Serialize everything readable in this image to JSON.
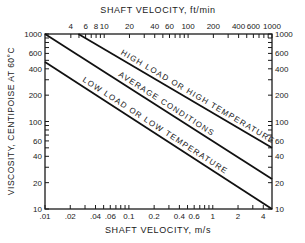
{
  "chart_data": {
    "type": "line",
    "title": "",
    "xlabel": "SHAFT VELOCITY, m/s",
    "x2label": "SHAFT VELOCITY, ft/min",
    "ylabel": "VISCOSITY, CENTIPOISE   AT 60°C",
    "xscale": "log",
    "yscale": "log",
    "xlim": [
      0.01,
      5.08
    ],
    "ylim": [
      10,
      1000
    ],
    "grid": false,
    "legend": "inline labels along lines",
    "x_ticks": [
      {
        "v": 0.01,
        "label": ".01"
      },
      {
        "v": 0.02,
        "label": ".02"
      },
      {
        "v": 0.03,
        "label": ""
      },
      {
        "v": 0.04,
        "label": ".04"
      },
      {
        "v": 0.05,
        "label": ""
      },
      {
        "v": 0.06,
        "label": ".06"
      },
      {
        "v": 0.07,
        "label": ""
      },
      {
        "v": 0.08,
        "label": ""
      },
      {
        "v": 0.09,
        "label": ""
      },
      {
        "v": 0.1,
        "label": "0.1"
      },
      {
        "v": 0.2,
        "label": "0.2"
      },
      {
        "v": 0.3,
        "label": ""
      },
      {
        "v": 0.4,
        "label": "0.4"
      },
      {
        "v": 0.5,
        "label": ""
      },
      {
        "v": 0.6,
        "label": "0.6"
      },
      {
        "v": 0.7,
        "label": ""
      },
      {
        "v": 0.8,
        "label": ""
      },
      {
        "v": 0.9,
        "label": ""
      },
      {
        "v": 1,
        "label": "1"
      },
      {
        "v": 2,
        "label": "2"
      },
      {
        "v": 3,
        "label": ""
      },
      {
        "v": 4,
        "label": "4"
      }
    ],
    "x2_ticks": [
      {
        "v": 4,
        "label": "4"
      },
      {
        "v": 5,
        "label": ""
      },
      {
        "v": 6,
        "label": "6"
      },
      {
        "v": 7,
        "label": ""
      },
      {
        "v": 8,
        "label": "8"
      },
      {
        "v": 9,
        "label": ""
      },
      {
        "v": 10,
        "label": "10"
      },
      {
        "v": 20,
        "label": "20"
      },
      {
        "v": 30,
        "label": ""
      },
      {
        "v": 40,
        "label": "40"
      },
      {
        "v": 50,
        "label": ""
      },
      {
        "v": 60,
        "label": "60"
      },
      {
        "v": 70,
        "label": ""
      },
      {
        "v": 80,
        "label": ""
      },
      {
        "v": 90,
        "label": ""
      },
      {
        "v": 100,
        "label": "100"
      },
      {
        "v": 200,
        "label": "200"
      },
      {
        "v": 300,
        "label": ""
      },
      {
        "v": 400,
        "label": "400"
      },
      {
        "v": 500,
        "label": ""
      },
      {
        "v": 600,
        "label": "600"
      },
      {
        "v": 700,
        "label": ""
      },
      {
        "v": 800,
        "label": ""
      },
      {
        "v": 900,
        "label": ""
      },
      {
        "v": 1000,
        "label": "1000"
      }
    ],
    "y_ticks": [
      {
        "v": 10,
        "label": "10"
      },
      {
        "v": 20,
        "label": "20"
      },
      {
        "v": 30,
        "label": ""
      },
      {
        "v": 40,
        "label": "40"
      },
      {
        "v": 50,
        "label": ""
      },
      {
        "v": 60,
        "label": "60"
      },
      {
        "v": 70,
        "label": ""
      },
      {
        "v": 80,
        "label": ""
      },
      {
        "v": 90,
        "label": ""
      },
      {
        "v": 100,
        "label": "100"
      },
      {
        "v": 200,
        "label": "200"
      },
      {
        "v": 300,
        "label": ""
      },
      {
        "v": 400,
        "label": "400"
      },
      {
        "v": 500,
        "label": ""
      },
      {
        "v": 600,
        "label": "600"
      },
      {
        "v": 700,
        "label": ""
      },
      {
        "v": 800,
        "label": ""
      },
      {
        "v": 900,
        "label": ""
      },
      {
        "v": 1000,
        "label": "1000"
      }
    ],
    "series": [
      {
        "name": "HIGH LOAD OR HIGH TEMPERATURE",
        "x": [
          0.025,
          5.08
        ],
        "y": [
          1000,
          50
        ]
      },
      {
        "name": "AVERAGE CONDITIONS",
        "x": [
          0.01,
          5.08
        ],
        "y": [
          1000,
          22
        ]
      },
      {
        "name": "LOW LOAD OR LOW TEMPERATURE",
        "x": [
          0.01,
          5.08
        ],
        "y": [
          480,
          10
        ]
      }
    ]
  }
}
